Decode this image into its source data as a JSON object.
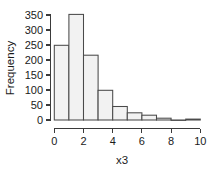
{
  "chart_data": {
    "type": "bar",
    "title": "",
    "subtitle": "",
    "xlabel": "x3",
    "ylabel": "Frequency",
    "categories": [
      "0-1",
      "1-2",
      "2-3",
      "3-4",
      "4-5",
      "5-6",
      "6-7",
      "7-8",
      "8-9",
      "9-10"
    ],
    "bin_edges": [
      0,
      1,
      2,
      3,
      4,
      5,
      6,
      7,
      8,
      9,
      10
    ],
    "values": [
      249,
      352,
      216,
      99,
      45,
      24,
      16,
      6,
      0,
      3
    ],
    "xlim": [
      0,
      10
    ],
    "ylim": [
      0,
      360
    ],
    "xticks": [
      0,
      2,
      4,
      6,
      8,
      10
    ],
    "yticks": [
      0,
      50,
      100,
      150,
      200,
      250,
      300,
      350
    ],
    "xtick_labels": [
      "0",
      "2",
      "4",
      "6",
      "8",
      "10"
    ],
    "ytick_labels": [
      "0",
      "50",
      "100",
      "150",
      "200",
      "250",
      "300",
      "350"
    ],
    "grid": false,
    "legend": null,
    "bar_fill": "#f2f2f2",
    "bar_stroke": "#4a4a4a",
    "axis_color": "#3a3a3a",
    "background": "#ffffff"
  }
}
